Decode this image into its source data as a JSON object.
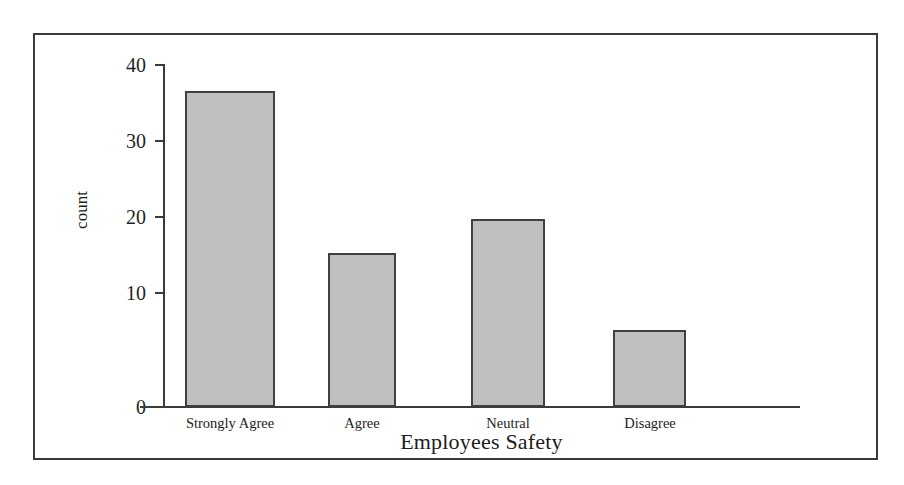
{
  "chart_data": {
    "type": "bar",
    "title": "",
    "subtitle": "",
    "xlabel": "Employees Safety",
    "ylabel": "count",
    "categories": [
      "Strongly Agree",
      "Agree",
      "Neutral",
      "Disagree"
    ],
    "values": [
      37,
      18,
      22,
      9
    ],
    "series": [
      {
        "name": "count",
        "values": [
          37,
          18,
          22,
          9
        ]
      }
    ],
    "ylim": [
      0,
      40
    ],
    "y_ticks": [
      0,
      10,
      20,
      30,
      40
    ],
    "y_tick_labels": [
      "0",
      "10",
      "20",
      "30",
      "40"
    ],
    "grid": false,
    "legend": false,
    "legend_position": "none",
    "annotations": [],
    "colors": {
      "bar_fill": "#bfbfbf",
      "bar_edge": "#404040",
      "axis": "#3b3b3b",
      "text": "#1d1d1d",
      "frame": "#3a3a3a",
      "background": "#ffffff"
    }
  }
}
